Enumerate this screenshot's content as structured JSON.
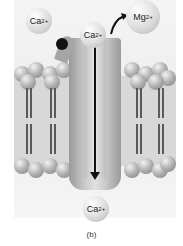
{
  "figure": {
    "caption": "(b)"
  },
  "ions": {
    "top_left": {
      "symbol": "Ca",
      "charge": "2+"
    },
    "top_center": {
      "symbol": "Ca",
      "charge": "2+"
    },
    "top_right": {
      "symbol": "Mg",
      "charge": "2+"
    },
    "bottom": {
      "symbol": "Ca",
      "charge": "2+"
    }
  }
}
